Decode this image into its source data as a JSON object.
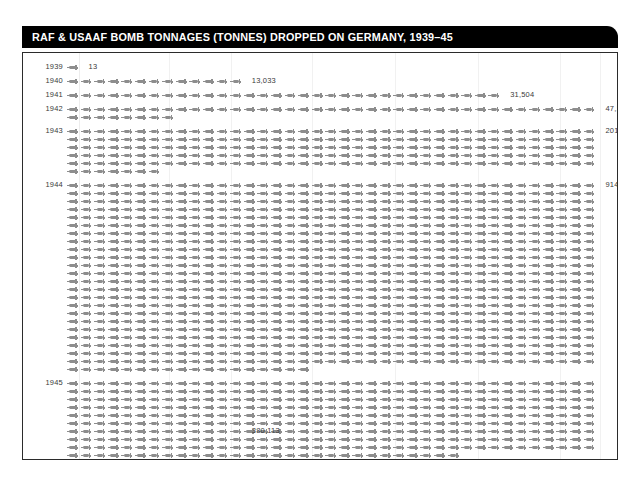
{
  "header": {
    "title": "RAF & USAAF BOMB TONNAGES (TONNES) DROPPED ON GERMANY, 1939–45"
  },
  "chart_data": {
    "type": "bar",
    "subtype": "pictogram-isotype",
    "title": "RAF & USAAF BOMB TONNAGES (TONNES) DROPPED ON GERMANY, 1939–45",
    "xlabel": "",
    "ylabel": "",
    "unit_label": "tonnes",
    "icon": "bomb-icon",
    "tonnes_per_icon": 1000,
    "icons_per_line": 39,
    "grid": true,
    "legend": "none",
    "categories": [
      "1939",
      "1940",
      "1941",
      "1942",
      "1943",
      "1944",
      "1945"
    ],
    "values": [
      13,
      13033,
      31504,
      47122,
      201622,
      914637,
      380113
    ],
    "value_labels": [
      "13",
      "13,033",
      "31,504",
      "47,122",
      "201,622",
      "914,637",
      "380,113"
    ],
    "series": [
      {
        "name": "Bomb tonnage dropped on Germany",
        "values": [
          13,
          13033,
          31504,
          47122,
          201622,
          914637,
          380113
        ]
      }
    ],
    "rows": [
      {
        "year": "1939",
        "value": 13,
        "value_label": "13",
        "icons": 1,
        "lines": 1
      },
      {
        "year": "1940",
        "value": 13033,
        "value_label": "13,033",
        "icons": 13,
        "lines": 5
      },
      {
        "year": "1941",
        "value": 31504,
        "value_label": "31,504",
        "icons": 32,
        "lines": 5
      },
      {
        "year": "1942",
        "value": 47122,
        "value_label": "47,122",
        "icons": 47,
        "lines": 5
      },
      {
        "year": "1943",
        "value": 201622,
        "value_label": "201,622",
        "icons": 202,
        "lines": 6
      },
      {
        "year": "1944",
        "value": 914637,
        "value_label": "914,637",
        "icons": 915,
        "lines": 24
      },
      {
        "year": "1945",
        "value": 380113,
        "value_label": "380,113",
        "icons": 380,
        "lines": 10
      }
    ]
  },
  "colors": {
    "titlebar_background": "#000000",
    "title_text": "#ffffff",
    "icon": "#8d8d8d",
    "icon_faint": "#d6d6d6",
    "frame_border": "#2b2b2b",
    "gridline": "#f1f1f1",
    "label_text": "#3a3a3a",
    "page_background": "#ffffff"
  }
}
